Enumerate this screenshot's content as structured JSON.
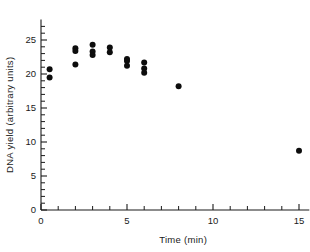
{
  "chart_data": {
    "type": "scatter",
    "title": "",
    "xlabel": "Time (min)",
    "ylabel": "DNA yield (arbitrary units)",
    "xlim": [
      0,
      15.6
    ],
    "ylim": [
      0,
      28
    ],
    "grid": false,
    "legend": null,
    "x_ticks_major": [
      0,
      5,
      10,
      15
    ],
    "x_ticklabels": [
      "0",
      "5",
      "10",
      "15"
    ],
    "x_ticks_minor": [
      1,
      2,
      3,
      4,
      6,
      7,
      8,
      9,
      11,
      12,
      13,
      14
    ],
    "y_ticks_major": [
      0,
      5,
      10,
      15,
      20,
      25
    ],
    "y_ticklabels": [
      "0",
      "5",
      "10",
      "15",
      "20",
      "25"
    ],
    "y_ticks_minor": [
      1,
      2,
      3,
      4,
      6,
      7,
      8,
      9,
      11,
      12,
      13,
      14,
      16,
      17,
      18,
      19,
      21,
      22,
      23,
      24,
      26,
      27
    ],
    "marker": "filled-circle",
    "marker_color": "#0d0d0d",
    "marker_size": 3.0,
    "points": [
      {
        "x": 0.5,
        "y": 20.7
      },
      {
        "x": 0.5,
        "y": 19.5
      },
      {
        "x": 2.0,
        "y": 23.8
      },
      {
        "x": 2.0,
        "y": 23.4
      },
      {
        "x": 2.0,
        "y": 21.4
      },
      {
        "x": 3.0,
        "y": 24.3
      },
      {
        "x": 3.0,
        "y": 23.3
      },
      {
        "x": 3.0,
        "y": 22.8
      },
      {
        "x": 4.0,
        "y": 23.9
      },
      {
        "x": 4.0,
        "y": 23.2
      },
      {
        "x": 5.0,
        "y": 22.2
      },
      {
        "x": 5.0,
        "y": 21.9
      },
      {
        "x": 5.0,
        "y": 21.2
      },
      {
        "x": 6.0,
        "y": 21.7
      },
      {
        "x": 6.0,
        "y": 20.8
      },
      {
        "x": 6.0,
        "y": 20.2
      },
      {
        "x": 8.0,
        "y": 18.2
      },
      {
        "x": 15.0,
        "y": 8.7
      }
    ]
  },
  "axes": {
    "x_title": "Time (min)",
    "y_title": "DNA yield (arbitrary units)"
  },
  "colors": {
    "axis": "#1a1a1a",
    "marker": "#0d0d0d",
    "background": "#ffffff"
  }
}
